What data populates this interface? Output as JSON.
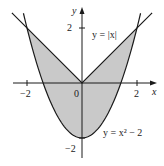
{
  "figure": {
    "type": "region-between-curves",
    "colors": {
      "shade": "#c9c9c9",
      "stroke": "#1a1a1a",
      "background": "#ffffff"
    },
    "axes": {
      "x_label": "x",
      "y_label": "y",
      "x_ticks": [
        {
          "value": -2,
          "label": "−2"
        },
        {
          "value": 2,
          "label": "2"
        }
      ],
      "y_ticks": [
        {
          "value": 2,
          "label": "2"
        },
        {
          "value": -2,
          "label": "−2"
        }
      ],
      "origin_label": "0"
    },
    "curves": [
      {
        "name": "abs",
        "equation_label": "y = |x|"
      },
      {
        "name": "parabola",
        "equation_label": "y = x² − 2"
      }
    ],
    "shaded_region": "between y = |x| and y = x² − 2 for −2 ≤ x ≤ 2"
  },
  "chart_data": {
    "type": "area",
    "title": "",
    "xlabel": "x",
    "ylabel": "y",
    "xlim": [
      -2.9,
      2.9
    ],
    "ylim": [
      -2.7,
      2.8
    ],
    "grid": false,
    "series": [
      {
        "name": "y = |x|",
        "x": [
          -2.55,
          -2,
          0,
          2,
          2.55
        ],
        "y": [
          2.55,
          2,
          0,
          2,
          2.55
        ]
      },
      {
        "name": "y = x² − 2",
        "x": [
          -2.13,
          -2,
          -1,
          0,
          1,
          2,
          2.13
        ],
        "y": [
          2.55,
          2,
          -1,
          -2,
          -1,
          2,
          2.55
        ]
      }
    ],
    "shaded": {
      "between": [
        "y = |x|",
        "y = x² − 2"
      ],
      "x_range": [
        -2,
        2
      ]
    },
    "tick_labels": {
      "x": [
        "−2",
        "0",
        "2"
      ],
      "y": [
        "2",
        "−2"
      ]
    },
    "annotations": [
      "y = |x|",
      "y = x² − 2"
    ]
  }
}
